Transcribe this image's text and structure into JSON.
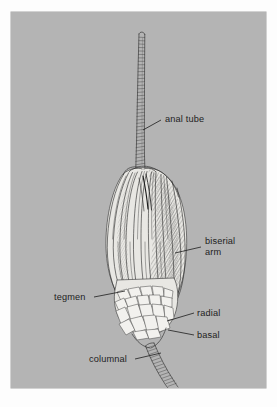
{
  "figure": {
    "background_color": "#b4b4b4",
    "page_color": "#fdfdfd",
    "ink_color": "#2b2b2b",
    "label_color": "#1d1d1d"
  },
  "labels": [
    {
      "id": "anal-tube",
      "text": "anal tube",
      "lines": [
        "anal tube"
      ],
      "text_x": 154,
      "text_y": 107,
      "anchor": "start",
      "leader": "M 150 108 L 132 118"
    },
    {
      "id": "biserial-arm",
      "text": "biserial arm",
      "lines": [
        "biserial",
        "arm"
      ],
      "text_x": 194,
      "text_y": 228,
      "anchor": "start",
      "leader": "M 190 235 L 164 241"
    },
    {
      "id": "tegmen",
      "text": "tegmen",
      "lines": [
        "tegmen"
      ],
      "text_x": 43,
      "text_y": 288,
      "anchor": "start",
      "leader": "M 83 285 L 114 279"
    },
    {
      "id": "radial",
      "text": "radial",
      "lines": [
        "radial"
      ],
      "text_x": 186,
      "text_y": 304,
      "anchor": "start",
      "leader": "M 183 301 L 156 309"
    },
    {
      "id": "basal",
      "text": "basal",
      "lines": [
        "basal"
      ],
      "text_x": 186,
      "text_y": 326,
      "anchor": "start",
      "leader": "M 183 323 L 157 318"
    },
    {
      "id": "columnal",
      "text": "columnal",
      "lines": [
        "columnal"
      ],
      "text_x": 78,
      "text_y": 350,
      "anchor": "start",
      "leader": "M 124 347 L 150 341"
    }
  ],
  "anatomy": {
    "anal_tube": "slender segmented tube rising from the centre of the crown",
    "arms": "ten long biserial arms curving up and outward from the calyx",
    "tegmen": "plated roof over the oral surface of the cup",
    "radial": "ring of radial plates forming the upper cup",
    "basal": "ring of basal plates forming the lower cup",
    "columnal": "stacked discs of the stalk descending from the base"
  }
}
